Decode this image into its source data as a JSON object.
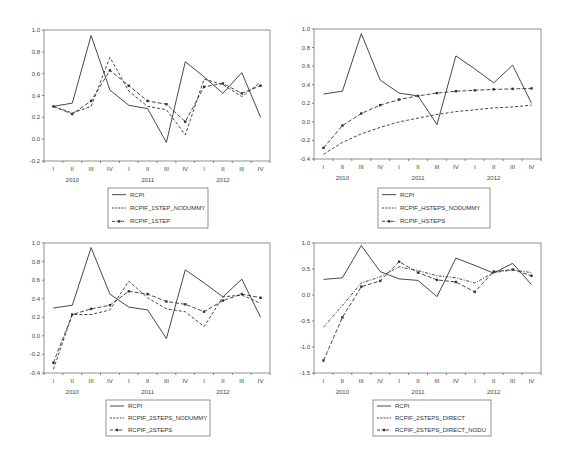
{
  "figure": {
    "x_categories": [
      "I",
      "II",
      "III",
      "IV",
      "I",
      "II",
      "III",
      "IV",
      "I",
      "II",
      "III",
      "IV"
    ],
    "x_years": [
      "2010",
      "2011",
      "2012"
    ]
  },
  "chart_data": [
    {
      "type": "line",
      "id": "top-left",
      "title": "",
      "xlabel": "",
      "ylabel": "",
      "categories": [
        "2010 I",
        "2010 II",
        "2010 III",
        "2010 IV",
        "2011 I",
        "2011 II",
        "2011 III",
        "2011 IV",
        "2012 I",
        "2012 II",
        "2012 III",
        "2012 IV"
      ],
      "ylim": [
        -0.2,
        1.0
      ],
      "yticks": [
        -0.2,
        0.0,
        0.2,
        0.4,
        0.6,
        0.8,
        1.0
      ],
      "ytick_labels": [
        "-0.2",
        "0.0",
        "0.2",
        "0.4",
        "0.6",
        "0.8",
        "1.0"
      ],
      "grid": false,
      "legend_position": "bottom-center",
      "series": [
        {
          "name": "RCPI",
          "style": "solid",
          "values": [
            0.3,
            0.33,
            0.95,
            0.45,
            0.31,
            0.28,
            -0.03,
            0.71,
            0.57,
            0.42,
            0.61,
            0.2
          ]
        },
        {
          "name": "RCPIF_1STEP_NODUMMY",
          "style": "dashed",
          "values": [
            0.3,
            0.24,
            0.3,
            0.75,
            0.44,
            0.3,
            0.27,
            0.04,
            0.55,
            0.5,
            0.39,
            0.52
          ]
        },
        {
          "name": "RCPIF_1STEP",
          "style": "dash-marker",
          "values": [
            0.3,
            0.23,
            0.35,
            0.63,
            0.49,
            0.35,
            0.32,
            0.16,
            0.48,
            0.51,
            0.42,
            0.49
          ]
        }
      ]
    },
    {
      "type": "line",
      "id": "top-right",
      "title": "",
      "xlabel": "",
      "ylabel": "",
      "categories": [
        "2010 I",
        "2010 II",
        "2010 III",
        "2010 IV",
        "2011 I",
        "2011 II",
        "2011 III",
        "2011 IV",
        "2012 I",
        "2012 II",
        "2012 III",
        "2012 IV"
      ],
      "ylim": [
        -0.4,
        1.0
      ],
      "yticks": [
        -0.4,
        -0.2,
        0.0,
        0.2,
        0.4,
        0.6,
        0.8,
        1.0
      ],
      "ytick_labels": [
        "-0.4",
        "-0.2",
        "0.0",
        "0.2",
        "0.4",
        "0.6",
        "0.8",
        "1.0"
      ],
      "grid": false,
      "legend_position": "bottom-center",
      "series": [
        {
          "name": "RCPI",
          "style": "solid",
          "values": [
            0.3,
            0.33,
            0.95,
            0.45,
            0.31,
            0.28,
            -0.03,
            0.71,
            0.57,
            0.42,
            0.61,
            0.2
          ]
        },
        {
          "name": "RCPIF_HSTEPS_NODUMMY",
          "style": "dashed",
          "values": [
            -0.35,
            -0.22,
            -0.13,
            -0.06,
            0.0,
            0.04,
            0.08,
            0.11,
            0.13,
            0.15,
            0.16,
            0.18
          ]
        },
        {
          "name": "RCPIF_HSTEPS",
          "style": "dash-marker",
          "values": [
            -0.28,
            -0.04,
            0.09,
            0.18,
            0.24,
            0.28,
            0.31,
            0.33,
            0.34,
            0.35,
            0.355,
            0.36
          ]
        }
      ]
    },
    {
      "type": "line",
      "id": "bottom-left",
      "title": "",
      "xlabel": "",
      "ylabel": "",
      "categories": [
        "2010 I",
        "2010 II",
        "2010 III",
        "2010 IV",
        "2011 I",
        "2011 II",
        "2011 III",
        "2011 IV",
        "2012 I",
        "2012 II",
        "2012 III",
        "2012 IV"
      ],
      "ylim": [
        -0.4,
        1.0
      ],
      "yticks": [
        -0.4,
        -0.2,
        0.0,
        0.2,
        0.4,
        0.6,
        0.8,
        1.0
      ],
      "ytick_labels": [
        "-0.4",
        "-0.2",
        "0.0",
        "0.2",
        "0.4",
        "0.6",
        "0.8",
        "1.0"
      ],
      "grid": false,
      "legend_position": "bottom-center",
      "series": [
        {
          "name": "RCPI",
          "style": "solid",
          "values": [
            0.3,
            0.33,
            0.95,
            0.45,
            0.31,
            0.28,
            -0.03,
            0.71,
            0.57,
            0.42,
            0.61,
            0.2
          ]
        },
        {
          "name": "RCPIF_2STEPS_NODUMMY",
          "style": "dashed",
          "values": [
            -0.36,
            0.23,
            0.23,
            0.28,
            0.59,
            0.41,
            0.29,
            0.26,
            0.1,
            0.42,
            0.44,
            0.35
          ]
        },
        {
          "name": "RCPIF_2STEPS",
          "style": "dash-marker",
          "values": [
            -0.29,
            0.23,
            0.29,
            0.33,
            0.48,
            0.45,
            0.37,
            0.34,
            0.26,
            0.38,
            0.45,
            0.41
          ]
        }
      ]
    },
    {
      "type": "line",
      "id": "bottom-right",
      "title": "",
      "xlabel": "",
      "ylabel": "",
      "categories": [
        "2010 I",
        "2010 II",
        "2010 III",
        "2010 IV",
        "2011 I",
        "2011 II",
        "2011 III",
        "2011 IV",
        "2012 I",
        "2012 II",
        "2012 III",
        "2012 IV"
      ],
      "ylim": [
        -1.5,
        1.0
      ],
      "yticks": [
        -1.5,
        -1.0,
        -0.5,
        0.0,
        0.5,
        1.0
      ],
      "ytick_labels": [
        "-1.5",
        "-1.0",
        "-0.5",
        "0.0",
        "0.5",
        "1.0"
      ],
      "grid": false,
      "legend_position": "bottom-center",
      "series": [
        {
          "name": "RCPI",
          "style": "solid",
          "values": [
            0.3,
            0.33,
            0.95,
            0.45,
            0.31,
            0.28,
            -0.03,
            0.71,
            0.57,
            0.42,
            0.61,
            0.2
          ]
        },
        {
          "name": "RCPIF_2STEPS_DIRECT",
          "style": "dash-dot",
          "values": [
            -0.62,
            -0.2,
            0.23,
            0.35,
            0.54,
            0.47,
            0.37,
            0.33,
            0.23,
            0.43,
            0.48,
            0.43
          ]
        },
        {
          "name": "RCPIF_2STEPS_DIRECT_NODU",
          "style": "dash-marker",
          "values": [
            -1.26,
            -0.43,
            0.16,
            0.27,
            0.64,
            0.43,
            0.29,
            0.25,
            0.06,
            0.45,
            0.49,
            0.37
          ]
        }
      ]
    }
  ],
  "layout": {
    "panels": [
      {
        "plot": [
          44,
          30,
          270,
          161
        ],
        "legend": [
          108,
          188,
          100,
          40
        ]
      },
      {
        "plot": [
          314,
          29,
          541,
          159
        ],
        "legend": [
          378,
          188,
          112,
          40
        ]
      },
      {
        "plot": [
          44,
          243,
          270,
          373
        ],
        "legend": [
          106,
          400,
          104,
          36
        ]
      },
      {
        "plot": [
          314,
          243,
          541,
          373
        ],
        "legend": [
          373,
          400,
          118,
          36
        ]
      }
    ],
    "colors": {
      "line": "#333333",
      "axis": "#555555",
      "text": "#444444"
    }
  }
}
